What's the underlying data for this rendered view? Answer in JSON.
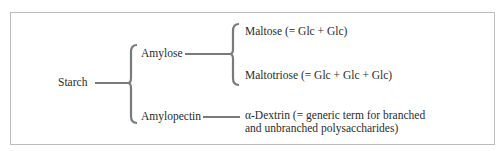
{
  "diagram": {
    "type": "tree",
    "root": {
      "id": "starch",
      "label": "Starch"
    },
    "level1": [
      {
        "id": "amylose",
        "label": "Amylose"
      },
      {
        "id": "amylopectin",
        "label": "Amylopectin"
      }
    ],
    "level2": {
      "amylose": [
        {
          "id": "maltose",
          "label": "Maltose (= Glc + Glc)"
        },
        {
          "id": "maltotriose",
          "label": "Maltotriose (= Glc + Glc + Glc)"
        }
      ],
      "amylopectin": [
        {
          "id": "dextrin",
          "label_line1": "α-Dextrin (= generic term for branched",
          "label_line2": "and unbranched polysaccharides)"
        }
      ]
    },
    "edges": [
      [
        "starch",
        "amylose"
      ],
      [
        "starch",
        "amylopectin"
      ],
      [
        "amylose",
        "maltose"
      ],
      [
        "amylose",
        "maltotriose"
      ],
      [
        "amylopectin",
        "dextrin"
      ]
    ],
    "colors": {
      "connector": "#7a7a7a",
      "frame": "#bdbdbd",
      "text": "#2b2b2b"
    }
  }
}
